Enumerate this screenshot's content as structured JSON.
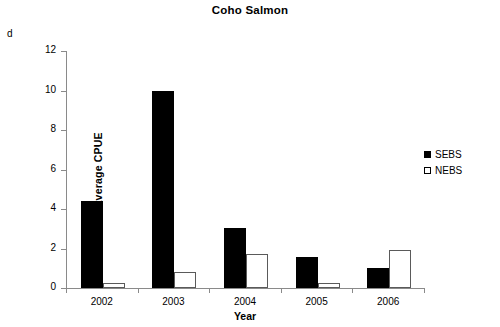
{
  "panel": {
    "label": "d"
  },
  "legend": {
    "position": "right",
    "entries": [
      {
        "name": "SEBS",
        "swatch": "filled-black-square"
      },
      {
        "name": "NEBS",
        "swatch": "open-white-square"
      }
    ]
  },
  "axes": {
    "y_ticks": [
      "0",
      "2",
      "4",
      "6",
      "8",
      "10",
      "12"
    ],
    "x_ticks": [
      "2002",
      "2003",
      "2004",
      "2005",
      "2006"
    ]
  },
  "chart_data": {
    "type": "bar",
    "title": "Coho Salmon",
    "xlabel": "Year",
    "ylabel": "Average CPUE",
    "categories": [
      "2002",
      "2003",
      "2004",
      "2005",
      "2006"
    ],
    "series": [
      {
        "name": "SEBS",
        "color": "#000000",
        "values": [
          4.4,
          10.0,
          3.05,
          1.55,
          1.0
        ]
      },
      {
        "name": "NEBS",
        "color": "#ffffff",
        "values": [
          0.25,
          0.8,
          1.72,
          0.25,
          1.95
        ]
      }
    ],
    "ylim": [
      0,
      12
    ],
    "ytick_step": 2,
    "grid": false,
    "legend_position": "right"
  }
}
